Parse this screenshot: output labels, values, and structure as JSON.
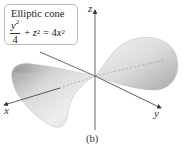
{
  "figure": {
    "title": "Elliptic cone",
    "equation": {
      "lhs_fraction_numerator": "y",
      "lhs_fraction_numerator_exp": "2",
      "lhs_fraction_denominator": "4",
      "plus": "+",
      "z_term": "z",
      "z_exp": "2",
      "equals": "=",
      "rhs_coef": "4",
      "rhs_var": "x",
      "rhs_exp": "2",
      "text": "y²/4 + z² = 4x²"
    },
    "axes": {
      "x_label": "x",
      "y_label": "y",
      "z_label": "z"
    },
    "caption": "(b)",
    "colors": {
      "surface_light": "#efefef",
      "surface_dark": "#9a9a9a",
      "axis": "#333333",
      "box_border": "#b9b9b9"
    }
  }
}
